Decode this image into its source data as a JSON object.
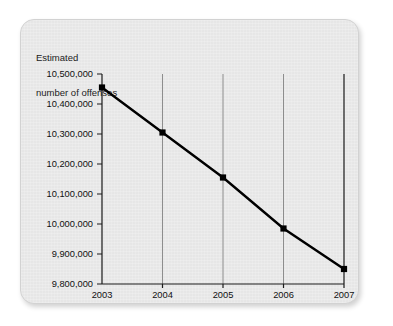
{
  "chart_data": {
    "type": "line",
    "title": "Estimated number of offenses",
    "title_lines": [
      "Estimated",
      "number of offenses"
    ],
    "xlabel": "",
    "ylabel": "Estimated number of offenses",
    "categories": [
      "2003",
      "2004",
      "2005",
      "2006",
      "2007"
    ],
    "x": [
      2003,
      2004,
      2005,
      2006,
      2007
    ],
    "values": [
      10455000,
      10305000,
      10155000,
      9985000,
      9850000
    ],
    "ylim": [
      9800000,
      10500000
    ],
    "ytick_values": [
      10500000,
      10400000,
      10300000,
      10200000,
      10100000,
      10000000,
      9900000,
      9800000
    ],
    "ytick_labels": [
      "10,500,000",
      "10,400,000",
      "10,300,000",
      "10,200,000",
      "10,100,000",
      "10,000,000",
      "9,900,000",
      "9,800,000"
    ],
    "xtick_labels": [
      "2003",
      "2004",
      "2005",
      "2006",
      "2007"
    ],
    "grid": "vertical-only",
    "legend": "none",
    "marker": "square",
    "line_color": "#000000",
    "marker_color": "#000000",
    "gridline_color": "#8d8d8d",
    "axis_color": "#1a1a1a",
    "background_color": "#e9e9e9",
    "text_color": "#111111"
  }
}
